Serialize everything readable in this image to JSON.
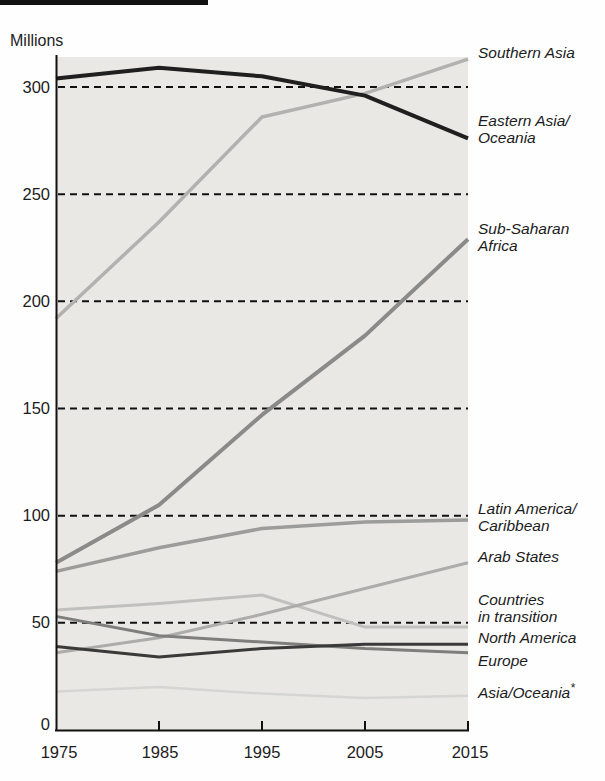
{
  "chart_data": {
    "type": "line",
    "title": "",
    "ylabel": "Millions",
    "xlim": [
      1975,
      2015
    ],
    "ylim": [
      0,
      314
    ],
    "x": [
      1975,
      1985,
      1995,
      2005,
      2015
    ],
    "x_tick_labels": [
      "1975",
      "1985",
      "1995",
      "2005",
      "2015"
    ],
    "yticks": [
      0,
      50,
      100,
      150,
      200,
      250,
      300
    ],
    "ytick_labels": [
      "0",
      "50",
      "100",
      "150",
      "200",
      "250",
      "300"
    ],
    "grid": "horizontal dashed black lines at each 50-unit tick",
    "legend_position": "right-edge annotations",
    "plot_background": "#e9e8e4",
    "axis_color": "#111111",
    "series": [
      {
        "name": "Southern Asia",
        "values": [
          192,
          237,
          286,
          297,
          313
        ],
        "color": "#b1b1af"
      },
      {
        "name": "Eastern Asia/Oceania",
        "values": [
          304,
          309,
          305,
          296,
          276
        ],
        "color": "#1f1f1f"
      },
      {
        "name": "Sub-Saharan Africa",
        "values": [
          78,
          105,
          147,
          184,
          229
        ],
        "color": "#8a8a88"
      },
      {
        "name": "Latin America/Caribbean",
        "values": [
          74,
          85,
          94,
          97,
          98
        ],
        "color": "#9c9c9a"
      },
      {
        "name": "Arab States",
        "values": [
          36,
          43,
          54,
          66,
          78
        ],
        "color": "#acacaa"
      },
      {
        "name": "Countries in transition",
        "values": [
          56,
          59,
          63,
          48,
          48
        ],
        "color": "#c0c0be"
      },
      {
        "name": "North America",
        "values": [
          39,
          34,
          38,
          40,
          40
        ],
        "color": "#3a3a3a"
      },
      {
        "name": "Europe",
        "values": [
          53,
          44,
          41,
          38,
          36
        ],
        "color": "#7e7e7c"
      },
      {
        "name": "Asia/Oceania*",
        "values": [
          18,
          20,
          17,
          15,
          16
        ],
        "color": "#d5d5d3"
      }
    ]
  },
  "annotations": [
    {
      "text": "Southern Asia"
    },
    {
      "text": "Eastern Asia/\nOceania"
    },
    {
      "text": "Sub-Saharan\nAfrica"
    },
    {
      "text": "Latin America/\nCaribbean"
    },
    {
      "text": "Arab States"
    },
    {
      "text": "Countries\nin transition"
    },
    {
      "text": "North America"
    },
    {
      "text": "Europe"
    },
    {
      "text": "Asia/Oceania",
      "suffix": "*"
    }
  ]
}
